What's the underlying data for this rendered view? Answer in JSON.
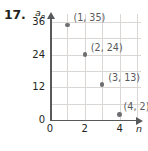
{
  "problem": {
    "number": "17."
  },
  "chart_data": {
    "type": "scatter",
    "title": "",
    "xlabel": "n",
    "ylabel": "a_n",
    "ylabel_base": "a",
    "ylabel_sub": "n",
    "x": [
      1,
      2,
      3,
      4
    ],
    "values": [
      35,
      24,
      13,
      2
    ],
    "point_labels": [
      "(1, 35)",
      "(2, 24)",
      "(3, 13)",
      "(4, 2)"
    ],
    "xlim": [
      0,
      5
    ],
    "ylim": [
      0,
      38
    ],
    "xticks": [
      0,
      2,
      4
    ],
    "xtick_labels": [
      "0",
      "2",
      "4"
    ],
    "yticks": [
      0,
      12,
      24,
      36
    ],
    "ytick_labels": [
      "0",
      "12",
      "24",
      "36"
    ],
    "x_gridlines": [
      1,
      2,
      3,
      4,
      5
    ],
    "y_gridlines": [
      6,
      12,
      18,
      24,
      30,
      36
    ],
    "grid": true,
    "legend": "none",
    "colors": {
      "point": "#6d6e71",
      "grid": "#d9d6d4",
      "axis": "#58595b",
      "label_text": "#58595b",
      "tick_text": "#231f20",
      "background": "#ffffff"
    }
  }
}
